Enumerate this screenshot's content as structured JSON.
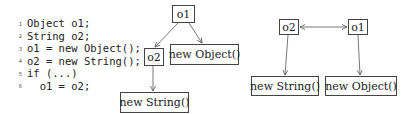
{
  "code": {
    "lines": [
      {
        "num": "1",
        "text": "Object o1;"
      },
      {
        "num": "2",
        "text": "String o2;"
      },
      {
        "num": "3",
        "text": "o1 = new Object();"
      },
      {
        "num": "4",
        "text": "o2 = new String();"
      },
      {
        "num": "5",
        "text": "if (...)"
      },
      {
        "num": "6",
        "text": "  o1 = o2;"
      }
    ]
  },
  "diagram_left": {
    "nodes": {
      "o1": "o1",
      "o2": "o2",
      "new_object": "new Object()",
      "new_string": "new String()"
    },
    "edges": [
      {
        "from": "o1",
        "to": "o2"
      },
      {
        "from": "o1",
        "to": "new Object()"
      },
      {
        "from": "o2",
        "to": "new String()"
      }
    ]
  },
  "diagram_right": {
    "nodes": {
      "o2": "o2",
      "o1": "o1",
      "new_string": "new String()",
      "new_object": "new Object()"
    },
    "edges": [
      {
        "from": "o2",
        "to": "o1",
        "bidirectional": true
      },
      {
        "from": "o2",
        "to": "new String()"
      },
      {
        "from": "o1",
        "to": "new Object()"
      }
    ]
  },
  "colors": {
    "stroke": "#555555",
    "text": "#222222"
  }
}
